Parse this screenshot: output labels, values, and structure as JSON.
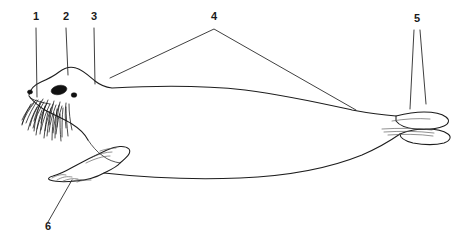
{
  "figure": {
    "name": "seal-anatomy-diagram",
    "type": "labeled-line-drawing",
    "view": "lateral-left-facing",
    "background_color": "#ffffff",
    "line_color": "#1d1d1d",
    "label_color": "#1a1a1a",
    "width": 467,
    "height": 244
  },
  "callouts": [
    {
      "id": "callout-1",
      "label": "1",
      "x": 36,
      "y": 20,
      "leader": "vertical",
      "target_x": 37,
      "target_y": 97
    },
    {
      "id": "callout-2",
      "label": "2",
      "x": 66,
      "y": 20,
      "leader": "vertical",
      "target_x": 68,
      "target_y": 75
    },
    {
      "id": "callout-3",
      "label": "3",
      "x": 94,
      "y": 20,
      "leader": "vertical",
      "target_x": 95,
      "target_y": 84
    },
    {
      "id": "callout-4",
      "label": "4",
      "x": 214,
      "y": 20,
      "leader": "v-branch",
      "target_x": 110,
      "target_y": 78,
      "target2_x": 356,
      "target2_y": 110
    },
    {
      "id": "callout-5",
      "label": "5",
      "x": 417,
      "y": 22,
      "leader": "double-vertical",
      "target_x": 410,
      "target_y": 109,
      "target2_x": 426,
      "target2_y": 104
    },
    {
      "id": "callout-6",
      "label": "6",
      "x": 48,
      "y": 230,
      "leader": "diagonal",
      "target_x": 72,
      "target_y": 180
    }
  ],
  "parts": [
    {
      "name": "nose",
      "callout": "1"
    },
    {
      "name": "head",
      "callout": "2"
    },
    {
      "name": "neck",
      "callout": "3"
    },
    {
      "name": "body",
      "callout": "4"
    },
    {
      "name": "hind-flippers",
      "callout": "5"
    },
    {
      "name": "fore-flipper-claws",
      "callout": "6"
    }
  ]
}
